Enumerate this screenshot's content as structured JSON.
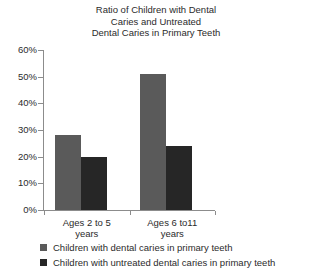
{
  "chart_data": {
    "type": "bar",
    "title": "Ratio of Children with Dental Caries and Untreated Dental Caries in Primary Teeth",
    "title_lines": [
      "Ratio of Children with Dental",
      "Caries and Untreated",
      "Dental Caries in Primary Teeth"
    ],
    "categories": [
      "Ages 2 to 5 years",
      "Ages 6 to11 years"
    ],
    "category_lines": [
      [
        "Ages 2 to 5",
        "years"
      ],
      [
        "Ages 6 to11",
        "years"
      ]
    ],
    "series": [
      {
        "name": "Children with dental caries in primary teeth",
        "color": "#5a5a5a",
        "values": [
          28,
          51
        ]
      },
      {
        "name": "Children with untreated dental caries in primary teeth",
        "color": "#262626",
        "values": [
          20,
          24
        ]
      }
    ],
    "xlabel": "",
    "ylabel": "",
    "ylim": [
      0,
      60
    ],
    "ytick_values": [
      0,
      10,
      20,
      30,
      40,
      50,
      60
    ],
    "ytick_labels": [
      "0%",
      "10%",
      "20%",
      "30%",
      "40%",
      "50%",
      "60%"
    ],
    "grid": false,
    "legend_position": "bottom"
  },
  "legend": {
    "entries": [
      {
        "label": "Children with dental caries in primary teeth"
      },
      {
        "label": "Children with untreated dental caries in primary teeth"
      }
    ]
  }
}
